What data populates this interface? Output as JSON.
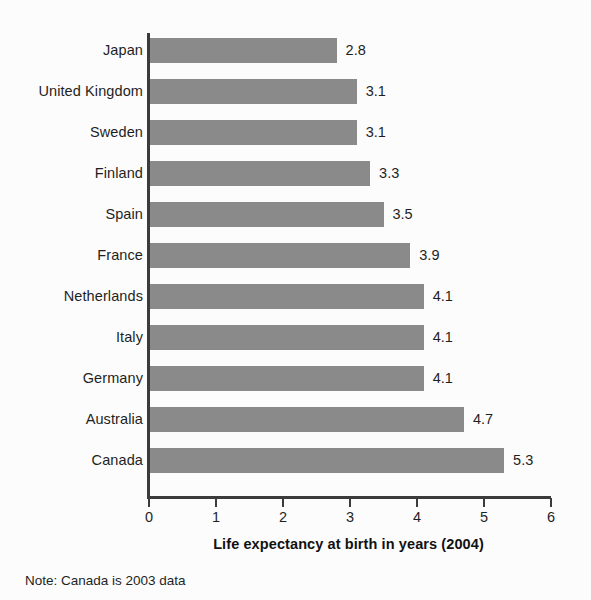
{
  "chart_data": {
    "type": "bar",
    "orientation": "horizontal",
    "title": "",
    "xlabel": "Life expectancy at birth in years (2004)",
    "ylabel": "",
    "xlim": [
      0,
      6
    ],
    "xticks": [
      "0",
      "1",
      "2",
      "3",
      "4",
      "5",
      "6"
    ],
    "grid": false,
    "legend": "none",
    "note": "Note: Canada is 2003 data",
    "categories": [
      "Japan",
      "United Kingdom",
      "Sweden",
      "Finland",
      "Spain",
      "France",
      "Netherlands",
      "Italy",
      "Germany",
      "Australia",
      "Canada"
    ],
    "values": [
      2.8,
      3.1,
      3.1,
      3.3,
      3.5,
      3.9,
      4.1,
      4.1,
      4.1,
      4.7,
      5.3
    ],
    "value_labels": [
      "2.8",
      "3.1",
      "3.1",
      "3.3",
      "3.5",
      "3.9",
      "4.1",
      "4.1",
      "4.1",
      "4.7",
      "5.3"
    ],
    "bar_color": "#8a8a8a",
    "axis_color": "#3b3b3b",
    "background_color": "#fcfcfc"
  }
}
